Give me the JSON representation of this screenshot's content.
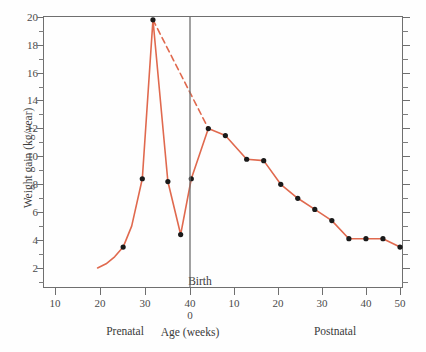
{
  "chart_data": {
    "type": "line",
    "title": "",
    "xlabel": "Age (weeks)",
    "ylabel": "Weight gain (kg/year)",
    "xlim": [
      6,
      56
    ],
    "ylim": [
      0.8,
      20
    ],
    "grid": false,
    "legend": null,
    "accent_color": "#E0694E",
    "axis_color": "#6f6f6f",
    "marker_color": "#1a1a1a",
    "birth_marker": {
      "label": "Birth",
      "x_weeks": 40,
      "note": "vertical line separating prenatal and postnatal scales"
    },
    "x_axis": {
      "label": "Age (weeks)",
      "prenatal_section_label": "Prenatal",
      "postnatal_section_label": "Postnatal",
      "prenatal_ticks": [
        10,
        20,
        30,
        40
      ],
      "postnatal_ticks": [
        10,
        20,
        30,
        40,
        50
      ],
      "birth_tick_labels": [
        "40",
        "0"
      ]
    },
    "y_axis": {
      "label": "Weight gain (kg/year)",
      "major_ticks": [
        2,
        4,
        6,
        8,
        10,
        12,
        14,
        16,
        18,
        20
      ],
      "minor_ticks": [
        1,
        3,
        5,
        7,
        9,
        11,
        13,
        15,
        17,
        19
      ],
      "units": "kg/year"
    },
    "series": [
      {
        "name": "Actual weight gain (solid)",
        "style": "solid",
        "points": [
          {
            "x": 20,
            "y": 2.0,
            "marker": false
          },
          {
            "x": 22,
            "y": 2.3,
            "marker": false
          },
          {
            "x": 24,
            "y": 2.8,
            "marker": false
          },
          {
            "x": 26,
            "y": 3.5,
            "marker": true
          },
          {
            "x": 28,
            "y": 5.0,
            "marker": false
          },
          {
            "x": 30.5,
            "y": 8.4,
            "marker": true
          },
          {
            "x": 33,
            "y": 19.8,
            "marker": true
          },
          {
            "x": 36.5,
            "y": 8.2,
            "marker": true
          },
          {
            "x": 39.5,
            "y": 4.4,
            "marker": true
          },
          {
            "x": 42,
            "y": 8.4,
            "marker": true
          },
          {
            "x": 46,
            "y": 12.0,
            "marker": true
          },
          {
            "x": 50,
            "y": 11.5,
            "marker": true
          },
          {
            "x": 55,
            "y": 9.8,
            "marker": true
          },
          {
            "x": 59,
            "y": 9.7,
            "marker": true
          },
          {
            "x": 63,
            "y": 8.0,
            "marker": true
          },
          {
            "x": 67,
            "y": 7.0,
            "marker": true
          },
          {
            "x": 71,
            "y": 6.2,
            "marker": true
          },
          {
            "x": 75,
            "y": 5.4,
            "marker": true
          },
          {
            "x": 79,
            "y": 4.1,
            "marker": true
          },
          {
            "x": 83,
            "y": 4.1,
            "marker": true
          },
          {
            "x": 87,
            "y": 4.1,
            "marker": true
          },
          {
            "x": 91,
            "y": 3.5,
            "marker": true
          }
        ]
      },
      {
        "name": "Projected / extrapolated fetal growth (dashed)",
        "style": "dashed",
        "points": [
          {
            "x": 33,
            "y": 19.8,
            "marker": false
          },
          {
            "x": 46,
            "y": 12.0,
            "marker": false
          }
        ]
      }
    ],
    "annotations": [
      {
        "text": "Birth",
        "x_weeks": 40
      },
      {
        "text": "Prenatal",
        "position": "below-axis-left"
      },
      {
        "text": "Postnatal",
        "position": "below-axis-right"
      }
    ]
  },
  "y_ticks": [
    {
      "value": "20",
      "top": 17
    },
    {
      "value": "18",
      "top": 45
    },
    {
      "value": "16",
      "top": 73
    },
    {
      "value": "14",
      "top": 100
    },
    {
      "value": "12",
      "top": 128
    },
    {
      "value": "10",
      "top": 156
    },
    {
      "value": "8",
      "top": 184
    },
    {
      "value": "6",
      "top": 212
    },
    {
      "value": "4",
      "top": 240
    },
    {
      "value": "2",
      "top": 268
    }
  ],
  "y_minor_tops": [
    31,
    59,
    87,
    114,
    142,
    170,
    198,
    226,
    254,
    282
  ],
  "x_ticks": [
    {
      "label": "10",
      "left": 55
    },
    {
      "label": "20",
      "left": 100
    },
    {
      "label": "30",
      "left": 145
    },
    {
      "label": "40",
      "left": 190
    },
    {
      "label": "10",
      "left": 234
    },
    {
      "label": "20",
      "left": 278
    },
    {
      "label": "30",
      "left": 322
    },
    {
      "label": "40",
      "left": 366
    },
    {
      "label": "50",
      "left": 400
    }
  ],
  "birth_sub_tick": {
    "label": "0",
    "left": 190
  },
  "labels": {
    "birth": "Birth",
    "x_axis_title": "Age (weeks)",
    "y_axis_title": "Weight gain (kg/year)",
    "prenatal": "Prenatal",
    "postnatal": "Postnatal"
  }
}
